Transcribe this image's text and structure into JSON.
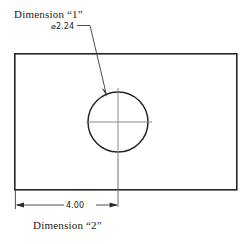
{
  "drawing": {
    "type": "mechanical-part-drawing",
    "title_annotations": {
      "hole_label": "Dimension “1”",
      "hole_callout": "⌀2.24",
      "width_value": "4.00",
      "width_label": "Dimension “2”"
    },
    "geometry": {
      "plate": {
        "shape": "rectangle",
        "x": 14,
        "y": 53,
        "width": 223,
        "height": 137
      },
      "hole": {
        "shape": "circle",
        "cx": 118,
        "cy": 122,
        "r": 30,
        "diameter_text": "⌀2.24"
      },
      "centerlines": {
        "horizontal_x1": 86,
        "horizontal_x2": 152,
        "vertical_y1": 88,
        "vertical_y2": 205
      },
      "leader": {
        "tick_x1": 78,
        "tick_x2": 90,
        "tick_y": 25,
        "line_x1": 90,
        "line_y1": 25,
        "line_x2": 107,
        "line_y2": 95
      },
      "dimension_line": {
        "y": 205,
        "x_left": 16,
        "x_right": 118,
        "text": "4.00"
      }
    },
    "colors": {
      "outline": "#262626",
      "centerline": "#8a8a8a",
      "annotation": "#3a3a3a",
      "background": "#ffffff"
    }
  }
}
